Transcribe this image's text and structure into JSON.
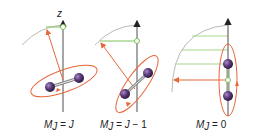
{
  "figure": {
    "axis_label": "z",
    "panels": [
      {
        "id": "mj-eq-j",
        "label": "M",
        "subscript": "J",
        "eq": " = J",
        "tail": ""
      },
      {
        "id": "mj-eq-j-minus-1",
        "label": "M",
        "subscript": "J",
        "eq": " = J",
        "tail": " − 1"
      },
      {
        "id": "mj-eq-0",
        "label": "M",
        "subscript": "J",
        "eq": " = 0",
        "tail": ""
      }
    ],
    "colors": {
      "axis": "#6b6b6b",
      "angular_momentum_vector": "#e8663a",
      "projection": "#7cc25a",
      "arc": "#b9b9b9",
      "atom": "#5a3a78",
      "bond": "#8a8a8a"
    }
  }
}
